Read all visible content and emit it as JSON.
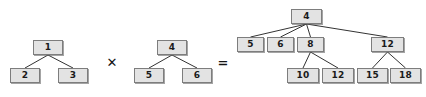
{
  "diagram": {
    "type": "tree-multiplication",
    "background_color": "#ffffff",
    "node_fill_color": "#e3e3e3",
    "node_border_color": "#7d7d7d",
    "edge_color": "#333333",
    "text_color": "#1a1a1a",
    "operators": [
      {
        "name": "times",
        "symbol": "✕",
        "x": 105,
        "y": 55,
        "w": 14,
        "h": 14
      },
      {
        "name": "equals",
        "symbol": "=",
        "x": 216,
        "y": 55,
        "w": 14,
        "h": 14
      }
    ],
    "trees": [
      {
        "name": "left-operand-tree",
        "root_value": "1",
        "nodes": [
          {
            "id": "L1",
            "label": "1",
            "x": 33,
            "y": 40,
            "w": 30,
            "h": 15
          },
          {
            "id": "L2",
            "label": "2",
            "x": 10,
            "y": 68,
            "w": 30,
            "h": 15
          },
          {
            "id": "L3",
            "label": "3",
            "x": 58,
            "y": 68,
            "w": 30,
            "h": 15
          }
        ],
        "edges": [
          {
            "from": "L1",
            "to": "L2"
          },
          {
            "from": "L1",
            "to": "L3"
          }
        ]
      },
      {
        "name": "right-operand-tree",
        "root_value": "4",
        "nodes": [
          {
            "id": "M4",
            "label": "4",
            "x": 157,
            "y": 40,
            "w": 30,
            "h": 15
          },
          {
            "id": "M5",
            "label": "5",
            "x": 134,
            "y": 68,
            "w": 30,
            "h": 15
          },
          {
            "id": "M6",
            "label": "6",
            "x": 182,
            "y": 68,
            "w": 30,
            "h": 15
          }
        ],
        "edges": [
          {
            "from": "M4",
            "to": "M5"
          },
          {
            "from": "M4",
            "to": "M6"
          }
        ]
      },
      {
        "name": "result-tree",
        "root_value": "4",
        "nodes": [
          {
            "id": "R4",
            "label": "4",
            "x": 291,
            "y": 9,
            "w": 31,
            "h": 15
          },
          {
            "id": "R5",
            "label": "5",
            "x": 237,
            "y": 37,
            "w": 27,
            "h": 15
          },
          {
            "id": "R6",
            "label": "6",
            "x": 267,
            "y": 37,
            "w": 27,
            "h": 15
          },
          {
            "id": "R8",
            "label": "8",
            "x": 297,
            "y": 37,
            "w": 27,
            "h": 15
          },
          {
            "id": "R12",
            "label": "12",
            "x": 371,
            "y": 37,
            "w": 33,
            "h": 15
          },
          {
            "id": "R10b",
            "label": "10",
            "x": 287,
            "y": 68,
            "w": 32,
            "h": 15
          },
          {
            "id": "R12b",
            "label": "12",
            "x": 322,
            "y": 68,
            "w": 32,
            "h": 15
          },
          {
            "id": "R15",
            "label": "15",
            "x": 357,
            "y": 68,
            "w": 31,
            "h": 15
          },
          {
            "id": "R18",
            "label": "18",
            "x": 390,
            "y": 68,
            "w": 31,
            "h": 15
          }
        ],
        "edges": [
          {
            "from": "R4",
            "to": "R5"
          },
          {
            "from": "R4",
            "to": "R6"
          },
          {
            "from": "R4",
            "to": "R8"
          },
          {
            "from": "R4",
            "to": "R12"
          },
          {
            "from": "R8",
            "to": "R10b"
          },
          {
            "from": "R8",
            "to": "R12b"
          },
          {
            "from": "R12",
            "to": "R15"
          },
          {
            "from": "R12",
            "to": "R18"
          }
        ]
      }
    ]
  }
}
